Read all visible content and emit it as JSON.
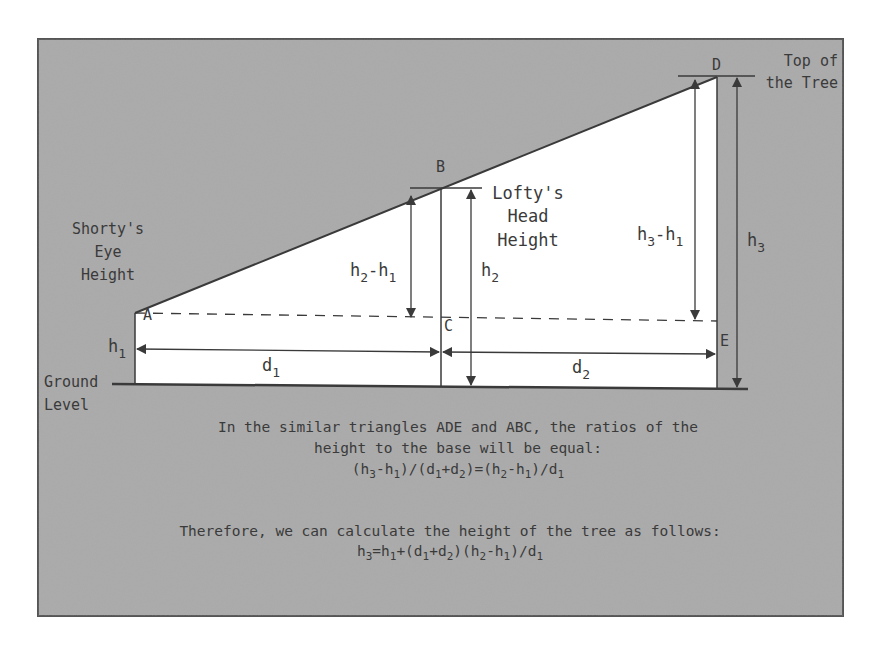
{
  "colors": {
    "panel_fill": "#a9a9a9",
    "panel_border": "#555555",
    "white_region": "#ffffff",
    "line": "#3a3a3a",
    "text": "#3a3a3a"
  },
  "points": {
    "A": "A",
    "B": "B",
    "C": "C",
    "D": "D",
    "E": "E"
  },
  "labels": {
    "shorty": [
      "Shorty's",
      "Eye",
      "Height"
    ],
    "lofty": [
      "Lofty's",
      "Head",
      "Height"
    ],
    "tree_top": [
      "Top of",
      "the Tree"
    ],
    "ground": [
      "Ground",
      "Level"
    ],
    "h1": {
      "base": "h",
      "sub": "1"
    },
    "h2": {
      "base": "h",
      "sub": "2"
    },
    "h3": {
      "base": "h",
      "sub": "3"
    },
    "d1": {
      "base": "d",
      "sub": "1"
    },
    "d2": {
      "base": "d",
      "sub": "2"
    },
    "h2_minus_h1": {
      "a": "h",
      "a_sub": "2",
      "op": "-",
      "b": "h",
      "b_sub": "1"
    },
    "h3_minus_h1": {
      "a": "h",
      "a_sub": "3",
      "op": "-",
      "b": "h",
      "b_sub": "1"
    }
  },
  "caption": {
    "line1": "In the similar triangles ADE and ABC, the ratios of the",
    "line2": "height to the base will be equal:",
    "equation1": "(h3-h1)/(d1+d2)=(h2-h1)/d1",
    "line3": "Therefore, we can calculate the height of the tree as follows:",
    "equation2": "h3=h1+(d1+d2)(h2-h1)/d1"
  }
}
